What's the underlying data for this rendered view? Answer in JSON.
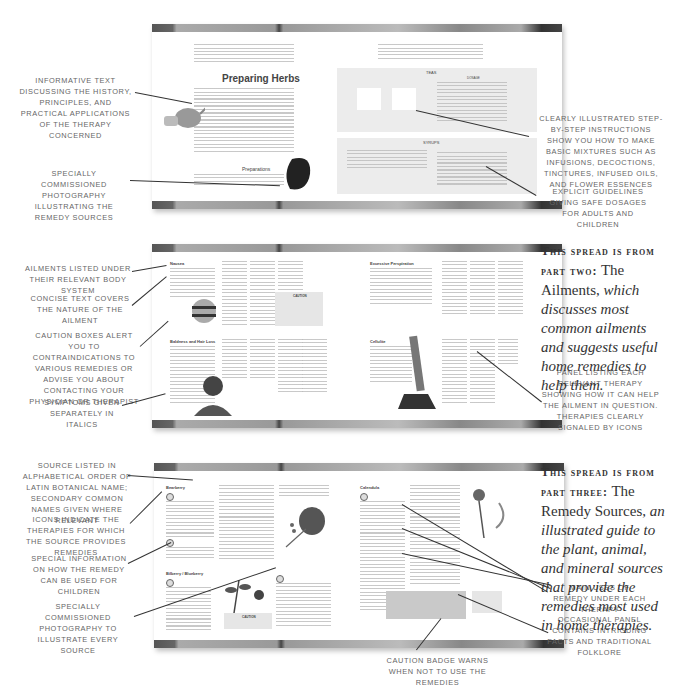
{
  "spread1": {
    "title": "Preparing Herbs",
    "subheading": "Preparations",
    "panel_teas": "TEAS",
    "panel_syrups": "SYRUPS",
    "dosage": "DOSAGE",
    "callouts": {
      "left_top": "Informative text discussing the history, principles, and practical applications of the therapy concerned",
      "left_bottom": "Specially commissioned photography illustrating the remedy sources",
      "right_top": "Clearly illustrated step-by-step instructions show you how to make basic mixtures such as infusions, decoctions, tinctures, infused oils, and flower essences",
      "right_bottom": "Explicit guidelines giving safe dosages for adults and children"
    }
  },
  "spread2": {
    "headings": [
      "Nausea",
      "Baldness and Hair Loss",
      "Excessive Perspiration",
      "Cellulite"
    ],
    "caution": "CAUTION",
    "callouts": {
      "left_1": "Ailments listed under their relevant body system",
      "left_2": "Concise text covers the nature of the ailment",
      "left_3": "Caution boxes alert you to contraindications to various remedies or advise you about contacting your physician or therapist",
      "left_4": "Symptoms given separately in italics",
      "right_panel": "Panel listing each relevant therapy showing how it can help the ailment in question. Therapies clearly signaled by icons"
    },
    "note": {
      "prefix": "This spread is from",
      "part": "part two:",
      "name": "The Ailments,",
      "desc": "which discusses most common ailments and suggests useful home remedies to help them."
    }
  },
  "spread3": {
    "headings": [
      "Bearberry",
      "Bilberry / Blueberry",
      "Calendula"
    ],
    "caution": "CAUTION",
    "callouts": {
      "left_1": "Source listed in alphabetical order of Latin botanical name; secondary common names given where relevant",
      "left_2": "Icons indicate the therapies for which the source provides remedies",
      "left_3": "Special information on how the remedy can be used for children",
      "left_4": "Specially commissioned photography to illustrate every source",
      "right_1": "Main uses of remedy under each therapy",
      "right_2": "Occasional panel contains intriguing facts and traditional folklore",
      "bottom": "Caution badge warns when not to use the remedies"
    },
    "note": {
      "prefix": "This spread is from",
      "part": "part three:",
      "name": "The Remedy Sources,",
      "desc": "an illustrated guide to the plant, animal, and mineral sources that provide the remedies most used in home therapies."
    }
  }
}
